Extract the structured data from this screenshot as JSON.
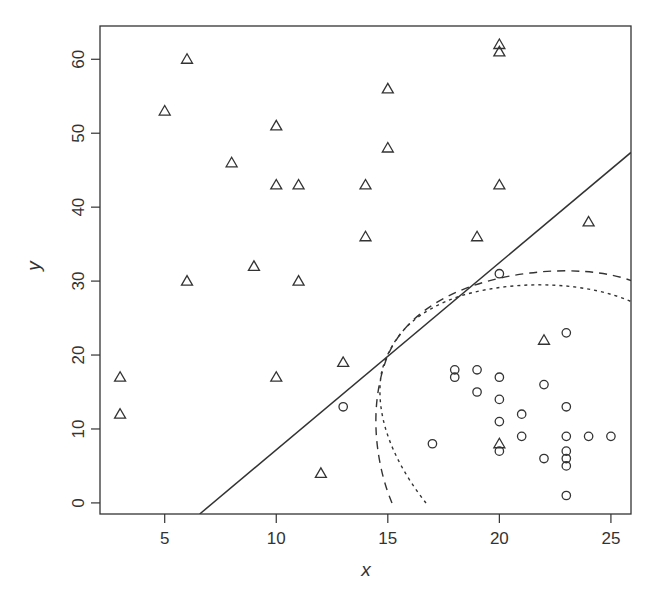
{
  "chart_data": {
    "type": "scatter",
    "title": "",
    "xlabel": "x",
    "ylabel": "y",
    "xlim": [
      2.1,
      25.9
    ],
    "ylim": [
      -1.5,
      64.5
    ],
    "xticks": [
      5,
      10,
      15,
      20,
      25
    ],
    "yticks": [
      0,
      10,
      20,
      30,
      40,
      50,
      60
    ],
    "grid": false,
    "legend": null,
    "series": [
      {
        "name": "triangles",
        "marker": "triangle",
        "points": [
          [
            3,
            17
          ],
          [
            3,
            12
          ],
          [
            5,
            53
          ],
          [
            6,
            60
          ],
          [
            6,
            30
          ],
          [
            8,
            46
          ],
          [
            9,
            32
          ],
          [
            10,
            51
          ],
          [
            10,
            43
          ],
          [
            10,
            17
          ],
          [
            11,
            43
          ],
          [
            11,
            30
          ],
          [
            12,
            4
          ],
          [
            13,
            19
          ],
          [
            14,
            43
          ],
          [
            14,
            36
          ],
          [
            15,
            56
          ],
          [
            15,
            48
          ],
          [
            19,
            36
          ],
          [
            20,
            62
          ],
          [
            20,
            61
          ],
          [
            20,
            43
          ],
          [
            20,
            8
          ],
          [
            22,
            22
          ],
          [
            24,
            38
          ]
        ]
      },
      {
        "name": "circles",
        "marker": "circle",
        "points": [
          [
            13,
            13
          ],
          [
            17,
            8
          ],
          [
            18,
            18
          ],
          [
            18,
            17
          ],
          [
            19,
            18
          ],
          [
            19,
            15
          ],
          [
            20,
            31
          ],
          [
            20,
            17
          ],
          [
            20,
            14
          ],
          [
            20,
            11
          ],
          [
            20,
            7
          ],
          [
            21,
            12
          ],
          [
            21,
            9
          ],
          [
            22,
            16
          ],
          [
            22,
            6
          ],
          [
            23,
            23
          ],
          [
            23,
            13
          ],
          [
            23,
            9
          ],
          [
            23,
            7
          ],
          [
            23,
            6
          ],
          [
            23,
            5
          ],
          [
            23,
            1
          ],
          [
            24,
            9
          ],
          [
            25,
            9
          ]
        ]
      }
    ],
    "lines": [
      {
        "name": "linear-boundary",
        "style": "solid",
        "points": [
          [
            6.57,
            -1.5
          ],
          [
            25.9,
            47.4
          ]
        ]
      }
    ],
    "curves": [
      {
        "name": "dashed-boundary",
        "style": "dashed",
        "description": "curved decision boundary from (15.2,0) arcing up to ~(23,28) and right edge at ~26"
      },
      {
        "name": "dotted-boundary",
        "style": "dotted",
        "description": "curved decision boundary from (16.6,0) arcing up to ~(20.5,27) and right edge at ~23"
      }
    ]
  },
  "colors": {
    "ink": "#333333",
    "background": "#ffffff"
  }
}
